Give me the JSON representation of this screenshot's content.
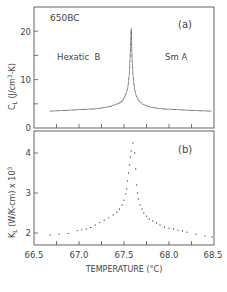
{
  "chart_data": [
    {
      "type": "scatter",
      "panel": "(a)",
      "title": "",
      "sample_label": "650BC",
      "panel_label": "(a)",
      "annotations": [
        "Hexatic B",
        "Sm A"
      ],
      "xlabel": "TEMPERATURE (°C)",
      "ylabel": "C_L (J/cm³-K)",
      "xlim": [
        66.5,
        68.5
      ],
      "ylim": [
        0,
        25
      ],
      "yticks": [
        0,
        5,
        10,
        15,
        20
      ],
      "ytick_labels": [
        "0",
        "",
        "10",
        "",
        "20"
      ],
      "grid": false,
      "series": [
        {
          "name": "C_L",
          "x": [
            66.68,
            66.8,
            66.9,
            67.0,
            67.1,
            67.2,
            67.3,
            67.35,
            67.4,
            67.45,
            67.48,
            67.5,
            67.52,
            67.54,
            67.55,
            67.56,
            67.565,
            67.57,
            67.575,
            67.58,
            67.585,
            67.59,
            67.6,
            67.61,
            67.62,
            67.63,
            67.65,
            67.68,
            67.7,
            67.75,
            67.8,
            67.9,
            68.0,
            68.1,
            68.2,
            68.3,
            68.4,
            68.48
          ],
          "y": [
            3.5,
            3.6,
            3.7,
            3.8,
            3.9,
            4.0,
            4.3,
            4.5,
            4.8,
            5.2,
            5.6,
            6.2,
            7.0,
            8.2,
            9.5,
            11.5,
            13.5,
            16,
            18,
            20.5,
            17,
            14,
            11,
            9.0,
            7.8,
            7.0,
            6.0,
            5.4,
            5.0,
            4.6,
            4.3,
            4.0,
            3.9,
            3.8,
            3.7,
            3.6,
            3.55,
            3.5
          ]
        }
      ]
    },
    {
      "type": "scatter",
      "panel": "(b)",
      "title": "",
      "panel_label": "(b)",
      "xlabel": "TEMPERATURE (°C)",
      "ylabel": "K_L (W/K-cm) x 10³",
      "xlim": [
        66.5,
        68.5
      ],
      "ylim": [
        1.7,
        4.55
      ],
      "xticks": [
        66.5,
        67.0,
        67.5,
        68.0,
        68.5
      ],
      "xtick_labels": [
        "66.5",
        "67.0",
        "67.5",
        "68.0",
        "68.5"
      ],
      "yticks": [
        2,
        3,
        4
      ],
      "ytick_labels": [
        "2",
        "3",
        "4"
      ],
      "grid": false,
      "series": [
        {
          "name": "K_L",
          "x": [
            66.68,
            66.78,
            66.88,
            66.98,
            67.03,
            67.08,
            67.13,
            67.18,
            67.23,
            67.28,
            67.33,
            67.38,
            67.42,
            67.45,
            67.48,
            67.5,
            67.52,
            67.53,
            67.54,
            67.55,
            67.56,
            67.57,
            67.58,
            67.6,
            67.62,
            67.63,
            67.64,
            67.65,
            67.66,
            67.68,
            67.7,
            67.72,
            67.75,
            67.78,
            67.82,
            67.86,
            67.9,
            67.95,
            68.0,
            68.05,
            68.1,
            68.15,
            68.2,
            68.3,
            68.4,
            68.48
          ],
          "y": [
            1.95,
            1.97,
            1.99,
            2.06,
            2.08,
            2.1,
            2.14,
            2.2,
            2.26,
            2.32,
            2.38,
            2.45,
            2.52,
            2.6,
            2.7,
            2.82,
            2.98,
            3.1,
            3.3,
            3.5,
            3.7,
            3.9,
            4.05,
            4.25,
            4.0,
            3.6,
            3.2,
            3.0,
            2.85,
            2.7,
            2.6,
            2.5,
            2.42,
            2.35,
            2.3,
            2.25,
            2.2,
            2.15,
            2.12,
            2.1,
            2.07,
            2.05,
            2.02,
            1.97,
            1.93,
            1.9
          ]
        }
      ]
    }
  ],
  "labels": {
    "sample": "650BC",
    "panel_a": "(a)",
    "panel_b": "(b)",
    "phase_low": "Hexatic  B",
    "phase_high": "Sm A",
    "ylabel_a": "C",
    "ylabel_a_sub": "L",
    "ylabel_a_rest": " (J/cm",
    "ylabel_a_sup": "3",
    "ylabel_a_end": "-K)",
    "ylabel_b": "K",
    "ylabel_b_sub": "L",
    "ylabel_b_rest": " (W/K-cm) x 10",
    "ylabel_b_sup": "3",
    "xlabel": "TEMPERATURE (°C)",
    "ytick_a_0": "0",
    "ytick_a_10": "10",
    "ytick_a_20": "20",
    "ytick_b_2": "2",
    "ytick_b_3": "3",
    "ytick_b_4": "4",
    "xtick_0": "66.5",
    "xtick_1": "67.0",
    "xtick_2": "67.5",
    "xtick_3": "68.0",
    "xtick_4": "68.5"
  },
  "colors": {
    "ink": "#444444",
    "background": "#ffffff"
  }
}
